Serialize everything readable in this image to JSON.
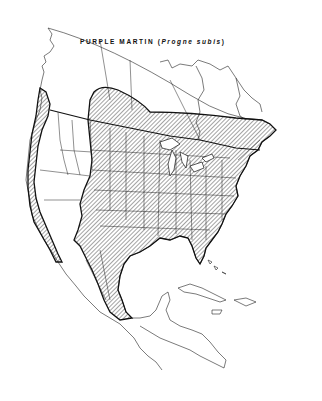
{
  "map": {
    "title_common": "PURPLE MARTIN",
    "title_open": " (",
    "title_scientific": "Progne subis",
    "title_close": ")",
    "region": "North America",
    "range_fill": "diagonal hatching",
    "colors": {
      "background": "#ffffff",
      "lines": "#111111",
      "hatch": "#333333"
    }
  }
}
